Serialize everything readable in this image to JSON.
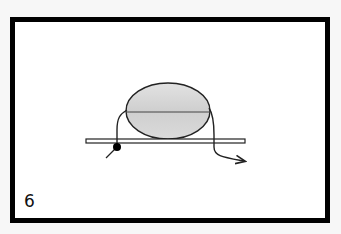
{
  "figure": {
    "step_number": "6",
    "colors": {
      "border": "#000000",
      "background": "#ffffff",
      "ellipse_fill": "#d6d6d6",
      "line": "#222222"
    },
    "shapes": {
      "ellipse": {
        "cx": 168,
        "cy": 111,
        "rx": 42,
        "ry": 28
      },
      "bar": {
        "x": 86,
        "y": 139,
        "width": 159,
        "height": 4
      },
      "knot_dot": {
        "cx": 117,
        "cy": 147,
        "r": 4
      }
    }
  }
}
